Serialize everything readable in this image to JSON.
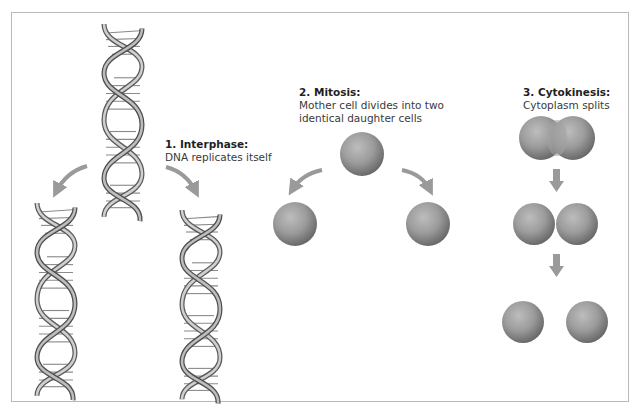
{
  "diagram": {
    "stages": [
      {
        "number": "1.",
        "title": "1. Interphase:",
        "description": "DNA replicates itself",
        "elements": [
          "parent-dna-helix",
          "daughter-dna-helix-left",
          "daughter-dna-helix-right"
        ]
      },
      {
        "number": "2.",
        "title": "2. Mitosis:",
        "description_lines": [
          "Mother cell divides into two",
          "identical daughter cells"
        ],
        "elements": [
          "mother-cell",
          "daughter-cell-left",
          "daughter-cell-right"
        ]
      },
      {
        "number": "3.",
        "title": "3. Cytokinesis:",
        "description": "Cytoplasm splits",
        "elements": [
          "pinching-cell",
          "touching-cells",
          "separated-cells"
        ]
      }
    ]
  },
  "colors": {
    "frame": "#b9b9b9",
    "arrow": "#9a9a9a",
    "helix_light": "#d8d8d8",
    "helix_dark": "#555555",
    "cell_light": "#b5b5b5",
    "cell_dark": "#6e6e6e",
    "text": "#2b2b2b"
  }
}
